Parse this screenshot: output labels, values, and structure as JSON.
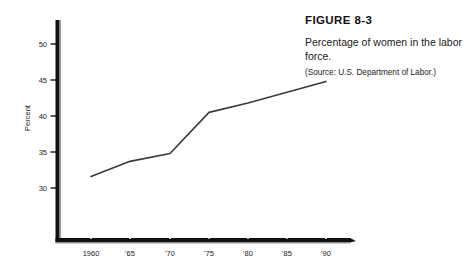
{
  "figure": {
    "number_label": "FIGURE 8-3",
    "caption": "Percentage of women in the labor force.",
    "source": "(Source: U.S. Department of Labor.)"
  },
  "chart_data": {
    "type": "line",
    "title": "Percentage of women in the labor force.",
    "xlabel": "",
    "ylabel": "Percent",
    "x": [
      1960,
      1965,
      1970,
      1975,
      1980,
      1985,
      1990
    ],
    "xtick_labels": [
      "1960",
      "'65",
      "'70",
      "'75",
      "'80",
      "'85",
      "'90"
    ],
    "values": [
      31.6,
      33.7,
      34.8,
      40.5,
      41.8,
      43.3,
      44.8
    ],
    "ytick_labels": [
      "30",
      "35",
      "40",
      "45",
      "50"
    ],
    "yticks": [
      30,
      35,
      40,
      45,
      50
    ],
    "ylim": [
      27.5,
      52.5
    ],
    "xlim": [
      1958,
      1992
    ],
    "grid": false,
    "legend": null,
    "line_color": "#3a3a3a",
    "axis_color": "#111111"
  },
  "axis": {
    "y_title": "Percent"
  }
}
